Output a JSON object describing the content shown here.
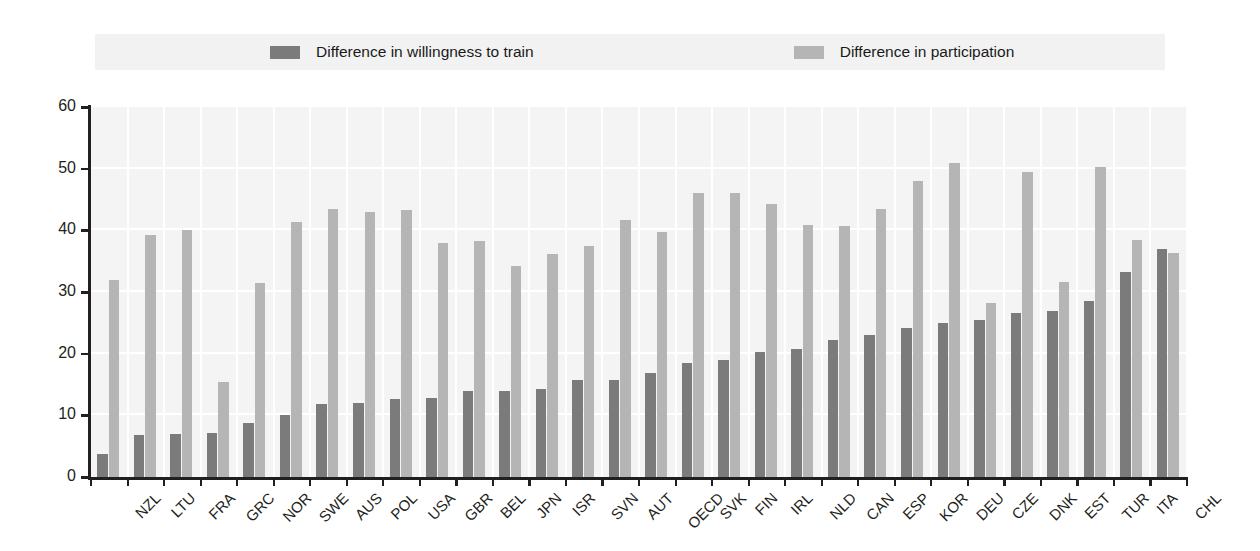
{
  "legend": {
    "items": [
      {
        "label": "Difference in willingness to train",
        "color": "#7b7b7b",
        "icon": "legend-swatch-dark"
      },
      {
        "label": "Difference in participation",
        "color": "#b5b5b5",
        "icon": "legend-swatch-light"
      }
    ]
  },
  "axis": {
    "y_ticks": [
      "0",
      "10",
      "20",
      "30",
      "40",
      "50",
      "60"
    ]
  },
  "chart_data": {
    "type": "bar",
    "title": "",
    "xlabel": "",
    "ylabel": "",
    "ylim": [
      0,
      60
    ],
    "ytick_step": 10,
    "grid": true,
    "legend_position": "top",
    "categories": [
      "NZL",
      "LTU",
      "FRA",
      "GRC",
      "NOR",
      "SWE",
      "AUS",
      "POL",
      "USA",
      "GBR",
      "BEL",
      "JPN",
      "ISR",
      "SVN",
      "AUT",
      "OECD",
      "SVK",
      "FIN",
      "IRL",
      "NLD",
      "CAN",
      "ESP",
      "KOR",
      "DEU",
      "CZE",
      "DNK",
      "EST",
      "TUR",
      "ITA",
      "CHL"
    ],
    "series": [
      {
        "name": "Difference in willingness to train",
        "color": "#7b7b7b",
        "values": [
          3.8,
          6.8,
          6.9,
          7.1,
          8.7,
          10.1,
          11.8,
          12.0,
          12.6,
          12.8,
          13.9,
          14.0,
          14.2,
          15.7,
          15.8,
          16.9,
          18.5,
          18.9,
          20.3,
          20.7,
          22.2,
          23.0,
          24.1,
          24.9,
          25.4,
          26.6,
          26.9,
          28.5,
          33.2,
          37.0
        ]
      },
      {
        "name": "Difference in participation",
        "color": "#b5b5b5",
        "values": [
          32.0,
          39.2,
          40.1,
          15.4,
          31.4,
          41.3,
          43.5,
          43.0,
          43.3,
          38.0,
          38.3,
          34.2,
          36.2,
          37.5,
          41.7,
          39.7,
          46.0,
          46.0,
          44.3,
          40.8,
          40.7,
          43.4,
          48.0,
          51.0,
          28.2,
          49.5,
          31.7,
          50.3,
          38.4,
          36.3
        ]
      }
    ]
  }
}
